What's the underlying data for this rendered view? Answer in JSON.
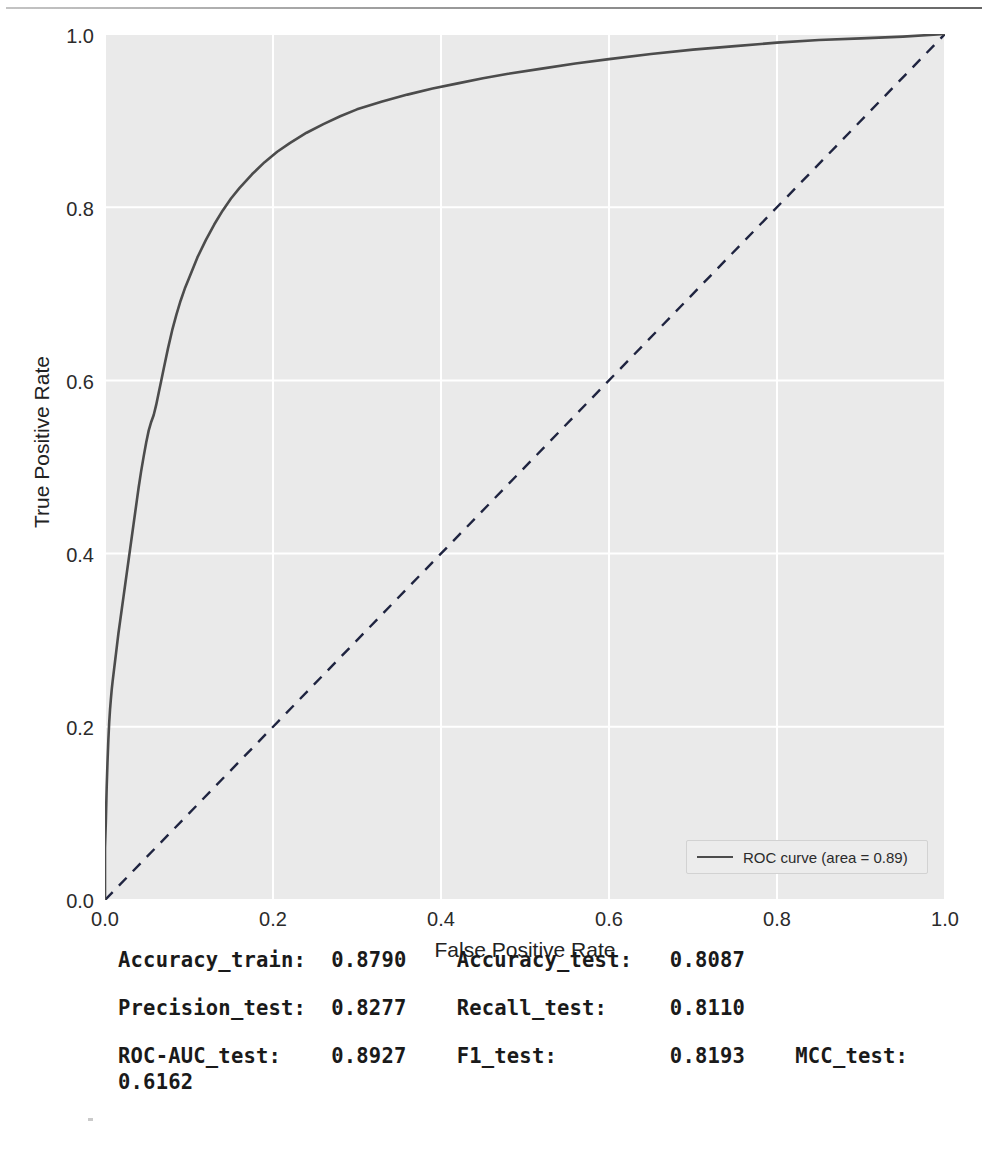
{
  "chart_data": {
    "type": "line",
    "title": "",
    "xlabel": "False Positive Rate",
    "ylabel": "True Positive Rate",
    "xlim": [
      0.0,
      1.0
    ],
    "ylim": [
      0.0,
      1.0
    ],
    "xticks": [
      "0.0",
      "0.2",
      "0.4",
      "0.6",
      "0.8",
      "1.0"
    ],
    "yticks": [
      "0.0",
      "0.2",
      "0.4",
      "0.6",
      "0.8",
      "1.0"
    ],
    "grid": true,
    "legend_position": "lower right",
    "legend": [
      "ROC curve (area = 0.89)"
    ],
    "series": [
      {
        "name": "ROC curve (area = 0.89)",
        "style": "solid",
        "color": "#4c4c4c",
        "auc": 0.89,
        "x": [
          0.0,
          0.0,
          0.001,
          0.002,
          0.003,
          0.004,
          0.005,
          0.006,
          0.007,
          0.008,
          0.009,
          0.01,
          0.011,
          0.012,
          0.013,
          0.014,
          0.015,
          0.016,
          0.018,
          0.02,
          0.022,
          0.024,
          0.026,
          0.028,
          0.03,
          0.032,
          0.034,
          0.036,
          0.038,
          0.04,
          0.043,
          0.046,
          0.049,
          0.052,
          0.055,
          0.058,
          0.061,
          0.064,
          0.067,
          0.07,
          0.075,
          0.08,
          0.085,
          0.09,
          0.095,
          0.1,
          0.11,
          0.12,
          0.13,
          0.14,
          0.15,
          0.16,
          0.175,
          0.19,
          0.205,
          0.22,
          0.24,
          0.26,
          0.28,
          0.3,
          0.33,
          0.36,
          0.39,
          0.42,
          0.45,
          0.48,
          0.52,
          0.56,
          0.6,
          0.65,
          0.7,
          0.75,
          0.8,
          0.85,
          0.9,
          0.95,
          1.0
        ],
        "y": [
          0.0,
          0.06,
          0.09,
          0.13,
          0.16,
          0.185,
          0.205,
          0.22,
          0.232,
          0.243,
          0.252,
          0.26,
          0.268,
          0.276,
          0.284,
          0.292,
          0.3,
          0.308,
          0.322,
          0.336,
          0.35,
          0.364,
          0.378,
          0.392,
          0.406,
          0.42,
          0.434,
          0.448,
          0.462,
          0.476,
          0.495,
          0.512,
          0.528,
          0.542,
          0.552,
          0.56,
          0.572,
          0.586,
          0.6,
          0.614,
          0.637,
          0.658,
          0.676,
          0.692,
          0.706,
          0.718,
          0.742,
          0.762,
          0.78,
          0.796,
          0.81,
          0.822,
          0.838,
          0.852,
          0.864,
          0.874,
          0.886,
          0.896,
          0.905,
          0.913,
          0.922,
          0.93,
          0.937,
          0.943,
          0.949,
          0.954,
          0.96,
          0.966,
          0.971,
          0.977,
          0.982,
          0.986,
          0.99,
          0.993,
          0.995,
          0.997,
          1.0
        ]
      },
      {
        "name": "chance-diagonal",
        "style": "dashed",
        "color": "#1f2440",
        "x": [
          0.0,
          1.0
        ],
        "y": [
          0.0,
          1.0
        ]
      }
    ]
  },
  "chart": {
    "xlabel": "False Positive Rate",
    "ylabel": "True Positive Rate",
    "legend_label": "ROC curve (area = 0.89)",
    "xticks": [
      "0.0",
      "0.2",
      "0.4",
      "0.6",
      "0.8",
      "1.0"
    ],
    "yticks": [
      "0.0",
      "0.2",
      "0.4",
      "0.6",
      "0.8",
      "1.0"
    ]
  },
  "metrics": {
    "rows": [
      "Accuracy_train:  0.8790    Accuracy_test:   0.8087",
      "Precision_test:  0.8277    Recall_test:     0.8110",
      "ROC-AUC_test:    0.8927    F1_test:         0.8193    MCC_test:\n0.6162"
    ],
    "items": [
      {
        "label": "Accuracy_train:",
        "value": "0.8790"
      },
      {
        "label": "Accuracy_test:",
        "value": "0.8087"
      },
      {
        "label": "Precision_test:",
        "value": "0.8277"
      },
      {
        "label": "Recall_test:",
        "value": "0.8110"
      },
      {
        "label": "ROC-AUC_test:",
        "value": "0.8927"
      },
      {
        "label": "F1_test:",
        "value": "0.8193"
      },
      {
        "label": "MCC_test:",
        "value": "0.6162"
      }
    ]
  },
  "colors": {
    "plot_background": "#eaeaea",
    "grid": "#ffffff",
    "roc_curve": "#4c4c4c",
    "diagonal": "#1f2440",
    "text": "#1a1a1a"
  }
}
